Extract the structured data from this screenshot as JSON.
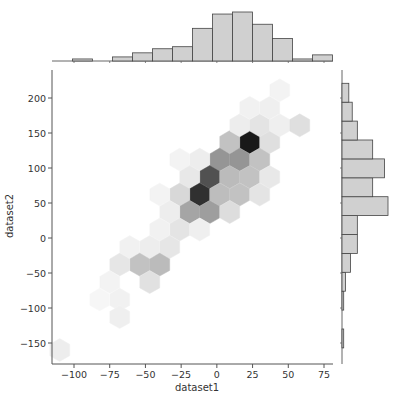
{
  "chart_data": {
    "type": "hexbin-jointplot",
    "title": "",
    "xlabel": "dataset1",
    "ylabel": "dataset2",
    "xlim": [
      -115,
      80
    ],
    "ylim": [
      -180,
      240
    ],
    "xticks": [
      -100,
      -75,
      -50,
      -25,
      0,
      25,
      50,
      75
    ],
    "yticks": [
      -150,
      -100,
      -50,
      0,
      50,
      100,
      150,
      200
    ],
    "grid": false,
    "colormap": "greys",
    "hexbins": [
      {
        "x": 23,
        "y": 137,
        "density": 1.0
      },
      {
        "x": 9,
        "y": 137,
        "density": 0.25
      },
      {
        "x": 37,
        "y": 137,
        "density": 0.12
      },
      {
        "x": 16,
        "y": 161,
        "density": 0.06
      },
      {
        "x": 30,
        "y": 161,
        "density": 0.1
      },
      {
        "x": 44,
        "y": 161,
        "density": 0.05
      },
      {
        "x": 58,
        "y": 161,
        "density": 0.12
      },
      {
        "x": 23,
        "y": 186,
        "density": 0.04
      },
      {
        "x": 37,
        "y": 186,
        "density": 0.05
      },
      {
        "x": 44,
        "y": 211,
        "density": 0.03
      },
      {
        "x": 2,
        "y": 112,
        "density": 0.45
      },
      {
        "x": 16,
        "y": 112,
        "density": 0.45
      },
      {
        "x": 30,
        "y": 112,
        "density": 0.25
      },
      {
        "x": -12,
        "y": 112,
        "density": 0.06
      },
      {
        "x": -26,
        "y": 112,
        "density": 0.03
      },
      {
        "x": -5,
        "y": 87,
        "density": 0.75
      },
      {
        "x": 9,
        "y": 87,
        "density": 0.28
      },
      {
        "x": 23,
        "y": 87,
        "density": 0.25
      },
      {
        "x": 37,
        "y": 87,
        "density": 0.08
      },
      {
        "x": -19,
        "y": 87,
        "density": 0.08
      },
      {
        "x": -12,
        "y": 62,
        "density": 0.9
      },
      {
        "x": 2,
        "y": 62,
        "density": 0.27
      },
      {
        "x": 16,
        "y": 62,
        "density": 0.25
      },
      {
        "x": 30,
        "y": 62,
        "density": 0.1
      },
      {
        "x": -26,
        "y": 62,
        "density": 0.15
      },
      {
        "x": -40,
        "y": 62,
        "density": 0.03
      },
      {
        "x": -19,
        "y": 37,
        "density": 0.38
      },
      {
        "x": -5,
        "y": 37,
        "density": 0.41
      },
      {
        "x": 9,
        "y": 37,
        "density": 0.13
      },
      {
        "x": -33,
        "y": 37,
        "density": 0.06
      },
      {
        "x": -26,
        "y": 12,
        "density": 0.1
      },
      {
        "x": -12,
        "y": 12,
        "density": 0.05
      },
      {
        "x": -40,
        "y": 12,
        "density": 0.04
      },
      {
        "x": -33,
        "y": -13,
        "density": 0.09
      },
      {
        "x": -47,
        "y": -13,
        "density": 0.06
      },
      {
        "x": -61,
        "y": -13,
        "density": 0.04
      },
      {
        "x": -54,
        "y": -38,
        "density": 0.25
      },
      {
        "x": -40,
        "y": -38,
        "density": 0.28
      },
      {
        "x": -68,
        "y": -38,
        "density": 0.09
      },
      {
        "x": -47,
        "y": -63,
        "density": 0.11
      },
      {
        "x": -75,
        "y": -63,
        "density": 0.03
      },
      {
        "x": -68,
        "y": -88,
        "density": 0.04
      },
      {
        "x": -82,
        "y": -88,
        "density": 0.02
      },
      {
        "x": -68,
        "y": -113,
        "density": 0.05
      },
      {
        "x": -110,
        "y": -160,
        "density": 0.06
      }
    ],
    "marginal_x": {
      "bin_edges": [
        -101,
        -87,
        -73,
        -59,
        -45,
        -31,
        -17,
        -3,
        11,
        25,
        39,
        53,
        67
      ],
      "counts": [
        1,
        0,
        2,
        4,
        6,
        7,
        16,
        23,
        24,
        18,
        11,
        1,
        3
      ]
    },
    "marginal_y": {
      "bin_edges": [
        -157,
        -130,
        -103,
        -76,
        -49,
        -22,
        5,
        32,
        59,
        86,
        113,
        140,
        167,
        194,
        221
      ],
      "counts": [
        1,
        0,
        1,
        2,
        5,
        9,
        9,
        27,
        18,
        25,
        18,
        9,
        6,
        4
      ],
      "order": "bottom-to-top"
    }
  }
}
